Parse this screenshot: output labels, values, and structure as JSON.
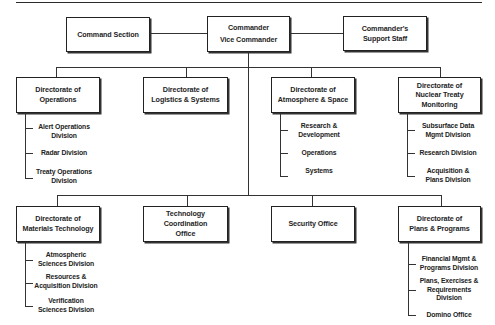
{
  "chart_title": "",
  "top": {
    "command_section": "Command Section",
    "commander": [
      "Commander",
      "Vice Commander"
    ],
    "support_staff": [
      "Commander's",
      "Support Staff"
    ]
  },
  "row1": [
    {
      "title": [
        "Directorate of",
        "Operations"
      ],
      "children": [
        [
          "Alert Operations",
          "Division"
        ],
        [
          "Radar Division"
        ],
        [
          "Treaty Operations",
          "Division"
        ]
      ]
    },
    {
      "title": [
        "Directorate of",
        "Logistics & Systems"
      ],
      "children": []
    },
    {
      "title": [
        "Directorate of",
        "Atmosphere & Space"
      ],
      "children": [
        [
          "Research &",
          "Development"
        ],
        [
          "Operations"
        ],
        [
          "Systems"
        ]
      ]
    },
    {
      "title": [
        "Directorate of",
        "Nuclear Treaty",
        "Monitoring"
      ],
      "children": [
        [
          "Subsurface Data",
          "Mgmt Division"
        ],
        [
          "Research Division"
        ],
        [
          "Acquisition &",
          "Plans Division"
        ]
      ]
    }
  ],
  "row2": [
    {
      "title": [
        "Directorate of",
        "Materials Technology"
      ],
      "children": [
        [
          "Atmospheric",
          "Sciences Division"
        ],
        [
          "Resources &",
          "Acquisition Division"
        ],
        [
          "Verification",
          "Sciences Division"
        ]
      ]
    },
    {
      "title": [
        "Technology Coordination",
        "Office"
      ],
      "children": []
    },
    {
      "title": [
        "Security Office"
      ],
      "children": []
    },
    {
      "title": [
        "Directorate of",
        "Plans & Programs"
      ],
      "children": [
        [
          "Financial Mgmt &",
          "Programs Division"
        ],
        [
          "Plans, Exercises &",
          "Requirements",
          "Division"
        ],
        [
          "Domino Office"
        ]
      ]
    }
  ]
}
